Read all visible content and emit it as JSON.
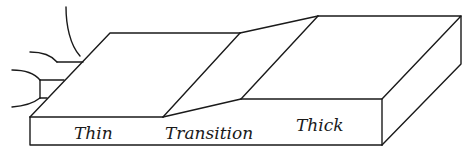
{
  "diagram": {
    "type": "3d-slab-regions",
    "regions": [
      {
        "id": "thin",
        "label": "Thin"
      },
      {
        "id": "transition",
        "label": "Transition"
      },
      {
        "id": "thick",
        "label": "Thick"
      }
    ],
    "colors": {
      "line": "#1a1a1a",
      "background": "#ffffff"
    }
  }
}
